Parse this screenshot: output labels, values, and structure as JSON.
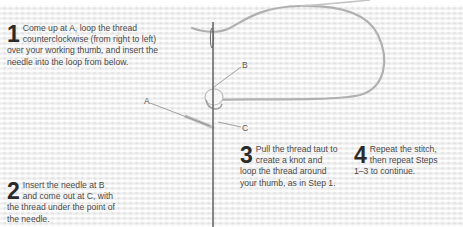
{
  "steps": [
    {
      "number": "1",
      "text": "Come up at A, loop the thread counterclockwise (from right to left) over your working thumb, and insert the needle into the loop from below."
    },
    {
      "number": "2",
      "text": "Insert the needle at B and come out at C, with the thread under the point of the needle."
    },
    {
      "number": "3",
      "text": "Pull the thread taut to create a knot and loop the thread around your thumb, as in Step 1."
    },
    {
      "number": "4",
      "text": "Repeat the stitch, then repeat Steps 1–3 to continue."
    }
  ],
  "labels": {
    "a": "A",
    "b": "B",
    "c": "C"
  },
  "colors": {
    "fabric": "#efefef",
    "thread": "#a8a8a8",
    "needle": "#6a6a6a",
    "text": "#4a4a4a"
  }
}
